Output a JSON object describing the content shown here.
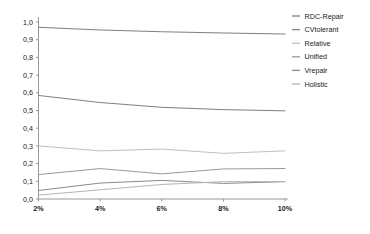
{
  "chart_data": {
    "type": "line",
    "title": "",
    "subtitle": "",
    "xlabel": "",
    "ylabel": "",
    "categories": [
      "2%",
      "4%",
      "6%",
      "8%",
      "10%"
    ],
    "xlim": [
      0,
      4
    ],
    "ylim": [
      0.0,
      1.0
    ],
    "ytick_labels": [
      "0,0",
      "0,1",
      "0,2",
      "0,3",
      "0,4",
      "0,5",
      "0,6",
      "0,7",
      "0,8",
      "0,9",
      "1,0"
    ],
    "ytick_values": [
      0.0,
      0.1,
      0.2,
      0.3,
      0.4,
      0.5,
      0.6,
      0.7,
      0.8,
      0.9,
      1.0
    ],
    "xtick_labels": [
      "2%",
      "4%",
      "6%",
      "8%",
      "10%"
    ],
    "grid": false,
    "legend_position": "right",
    "series": [
      {
        "name": "RDC-Repair",
        "color": "#808080",
        "values": [
          0.97,
          0.955,
          0.945,
          0.938,
          0.932
        ]
      },
      {
        "name": "CVtolerant",
        "color": "#808080",
        "values": [
          0.585,
          0.545,
          0.518,
          0.505,
          0.498
        ]
      },
      {
        "name": "Relative",
        "color": "#c0c0c0",
        "values": [
          0.3,
          0.272,
          0.282,
          0.258,
          0.272
        ]
      },
      {
        "name": "Unified",
        "color": "#9a9a9a",
        "values": [
          0.138,
          0.172,
          0.142,
          0.17,
          0.172
        ]
      },
      {
        "name": "Vrepair",
        "color": "#8a8a8a",
        "values": [
          0.048,
          0.09,
          0.105,
          0.088,
          0.098
        ]
      },
      {
        "name": "Holistic",
        "color": "#b4b4b4",
        "values": [
          0.022,
          0.052,
          0.082,
          0.098,
          0.098
        ]
      }
    ]
  },
  "legend": {
    "items": [
      {
        "label": "RDC-Repair",
        "color": "#808080"
      },
      {
        "label": "CVtolerant",
        "color": "#808080"
      },
      {
        "label": "Relative",
        "color": "#c0c0c0"
      },
      {
        "label": "Unified",
        "color": "#9a9a9a"
      },
      {
        "label": "Vrepair",
        "color": "#8a8a8a"
      },
      {
        "label": "Holistic",
        "color": "#b4b4b4"
      }
    ]
  },
  "axes": {
    "axis_color": "#8c8c8c"
  }
}
